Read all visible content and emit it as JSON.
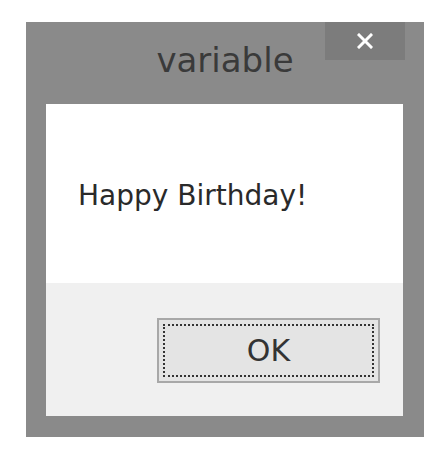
{
  "dialog": {
    "title": "variable",
    "message": "Happy Birthday!",
    "buttons": {
      "ok_label": "OK"
    },
    "close_icon": "close-icon",
    "colors": {
      "frame": "#8a8a8a",
      "close_button_bg": "#7c7c7c",
      "client_bg": "#ffffff",
      "footer_bg": "#f0f0f0",
      "button_border": "#a8a8a8",
      "button_bg": "#e4e4e4",
      "text": "#2a2a2a"
    }
  }
}
